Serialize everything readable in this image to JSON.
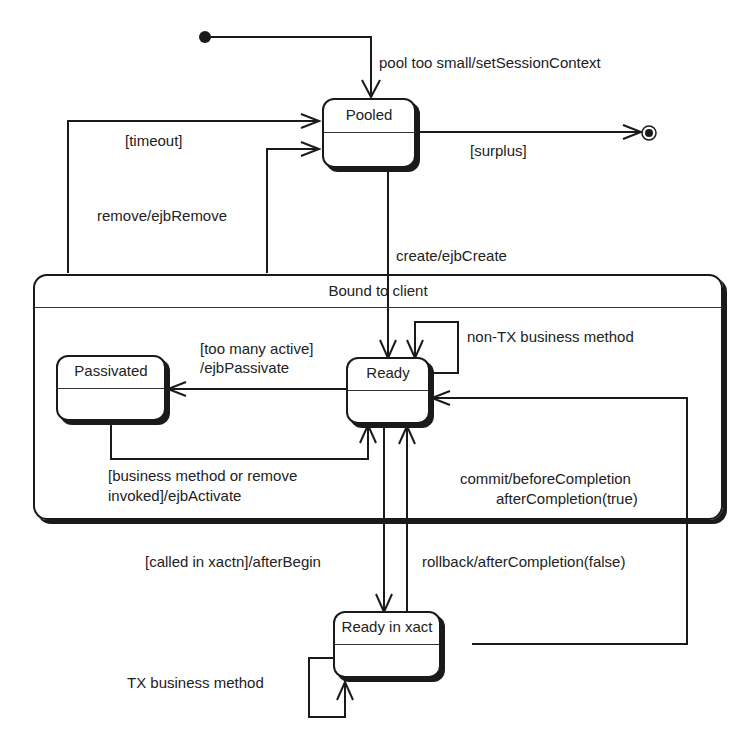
{
  "diagram": {
    "type": "UML state machine",
    "pseudo_states": {
      "initial": "initial-state",
      "final": "final-state"
    },
    "states": {
      "pooled": "Pooled",
      "bound": "Bound to client",
      "passivated": "Passivated",
      "ready": "Ready",
      "ready_in_xact": "Ready in xact"
    },
    "transitions": {
      "initial_to_pooled": "pool too small/setSessionContext",
      "timeout": "[timeout]",
      "surplus": "[surplus]",
      "remove": "remove/ejbRemove",
      "create": "create/ejbCreate",
      "non_tx_line1": "non-TX business method",
      "passivate_line1": "[too many active]",
      "passivate_line2": "/ejbPassivate",
      "activate_line1": "[business method or remove",
      "activate_line2": "invoked]/ejbActivate",
      "commit_line1": "commit/beforeCompletion",
      "commit_line2": "afterCompletion(true)",
      "after_begin": "[called in xactn]/afterBegin",
      "rollback": "rollback/afterCompletion(false)",
      "tx_business": "TX business method"
    }
  }
}
